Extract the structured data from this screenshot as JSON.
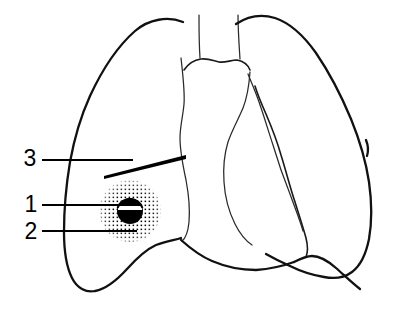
{
  "figure": {
    "view": "frontal",
    "background_color": "#ffffff",
    "ink_color": "#000000"
  },
  "labels": [
    {
      "id": "label-3",
      "text": "3",
      "text_x": 30,
      "text_y": 160,
      "leader": {
        "x1": 42,
        "y1": 160,
        "x2": 133,
        "y2": 160
      },
      "points_to": "linear-opacity-streak"
    },
    {
      "id": "label-1",
      "text": "1",
      "text_x": 31,
      "text_y": 206,
      "leader": {
        "x1": 42,
        "y1": 205,
        "x2": 124,
        "y2": 205
      },
      "points_to": "nodule-core"
    },
    {
      "id": "label-2",
      "text": "2",
      "text_x": 31,
      "text_y": 233,
      "leader": {
        "x1": 42,
        "y1": 231,
        "x2": 137,
        "y2": 231
      },
      "points_to": "nodule-halo"
    }
  ],
  "features": {
    "nodule": {
      "name": "pulmonary nodule",
      "center_x": 130,
      "center_y": 211,
      "core_radius": 13,
      "halo_radius": 30,
      "core_color": "#000000",
      "halo_pattern": "stipple",
      "band_color": "#ffffff"
    },
    "streak": {
      "name": "linear opacity",
      "x1": 104,
      "y1": 174,
      "x2": 185,
      "y2": 156
    }
  },
  "legend_present": false
}
